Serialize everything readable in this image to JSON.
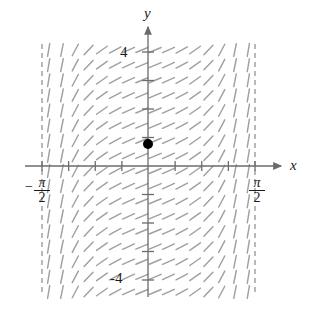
{
  "figure": {
    "type": "slope-field",
    "background": "#ffffff"
  },
  "axes": {
    "x_label": "x",
    "y_label": "y",
    "x_axis_color": "#6b6b6b",
    "y_axis_color": "#6b6b6b",
    "x_axis_y_px": 166,
    "y_axis_x_px": 148,
    "x_range_label_left": "-pi/2",
    "x_range_label_right": "pi/2"
  },
  "tick_labels": {
    "y_positive": "4",
    "y_negative": "-4",
    "x_left_sign": "−",
    "x_left_numerator": "π",
    "x_left_denominator": "2",
    "x_right_numerator": "π",
    "x_right_denominator": "2"
  },
  "asymptotes": {
    "color": "#8a8a8a",
    "style": "dashed",
    "left_x_px": 42,
    "right_x_px": 255,
    "top_y_px": 44,
    "bottom_y_px": 292
  },
  "point": {
    "label": "initial-condition-point",
    "color": "#000000",
    "x_px": 148,
    "y_px": 144,
    "radius_px": 5,
    "x_value": 0,
    "y_value": 1
  },
  "slope_field": {
    "segment_color": "#a0a0a0",
    "segment_length_px": 13,
    "columns": 16,
    "rows": 17,
    "equation_hint": "dy/dx = sec^2(x)",
    "x_min": -1.5707963,
    "x_max": 1.5707963,
    "y_min": -5.2,
    "y_max": 5.2
  },
  "chart_data": {
    "type": "scatter",
    "title": "",
    "xlabel": "x",
    "ylabel": "y",
    "xlim": [
      -1.5707963,
      1.5707963
    ],
    "ylim": [
      -5.2,
      5.2
    ],
    "grid": false,
    "legend": null,
    "xticks": [
      -1.5707963,
      -1.3744468,
      -1.1780972,
      -0.9817477,
      -0.7853982,
      -0.5890486,
      -0.3926991,
      -0.1963495,
      0,
      0.1963495,
      0.3926991,
      0.5890486,
      0.7853982,
      0.9817477,
      1.1780972,
      1.3744468,
      1.5707963
    ],
    "xtick_labels": [
      "-π/2",
      "",
      "",
      "",
      "",
      "",
      "",
      "",
      "",
      "",
      "",
      "",
      "",
      "",
      "",
      "",
      "π/2"
    ],
    "yticks": [
      -4,
      -3,
      -2,
      -1,
      0,
      1,
      2,
      3,
      4
    ],
    "ytick_labels": [
      "-4",
      "",
      "",
      "",
      "",
      "",
      "",
      "",
      "4"
    ],
    "annotations": [
      {
        "text": "vertical asymptote",
        "x": -1.5707963,
        "style": "dashed"
      },
      {
        "text": "vertical asymptote",
        "x": 1.5707963,
        "style": "dashed"
      }
    ],
    "series": [
      {
        "name": "initial-condition-point",
        "type": "scatter",
        "x": [
          0
        ],
        "y": [
          1
        ],
        "color": "#000000",
        "marker": "filled-circle"
      },
      {
        "name": "slope-field",
        "type": "direction-field",
        "slope_function": "sec(x)^2",
        "color": "#a0a0a0"
      }
    ]
  }
}
